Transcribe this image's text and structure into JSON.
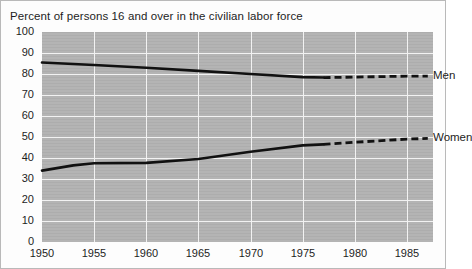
{
  "chart_data": {
    "type": "line",
    "title": "Percent of persons 16 and over in the civilian labor force",
    "xlabel": "",
    "ylabel": "",
    "xlim": [
      1950,
      1987.5
    ],
    "ylim": [
      0,
      100
    ],
    "xticks": [
      "1950",
      "1955",
      "1960",
      "1965",
      "1970",
      "1975",
      "1980",
      "1985"
    ],
    "yticks": [
      "0",
      "10",
      "20",
      "30",
      "40",
      "50",
      "60",
      "70",
      "80",
      "90",
      "100"
    ],
    "grid": true,
    "legend_position": "right-inline",
    "plot_background": "#b4b4b4",
    "gridline_color": "#f2f2f2",
    "line_color": "#111111",
    "note": "Solid segments are observed data through 1977; dashed segments are projections.",
    "series": [
      {
        "name": "Men",
        "label": "Men",
        "solid_x": [
          1950,
          1955,
          1960,
          1965,
          1970,
          1975,
          1977
        ],
        "solid_values": [
          85.5,
          84.3,
          83.0,
          81.5,
          80.0,
          78.5,
          78.3
        ],
        "dashed_x": [
          1977,
          1980,
          1985,
          1987
        ],
        "dashed_values": [
          78.3,
          78.5,
          79.0,
          79.0
        ]
      },
      {
        "name": "Women",
        "label": "Women",
        "solid_x": [
          1950,
          1953,
          1955,
          1960,
          1965,
          1970,
          1975,
          1977
        ],
        "solid_values": [
          34.0,
          36.5,
          37.5,
          37.7,
          39.5,
          43.0,
          46.0,
          46.5
        ],
        "dashed_x": [
          1977,
          1980,
          1985,
          1987
        ],
        "dashed_values": [
          46.5,
          47.5,
          49.0,
          49.3
        ]
      }
    ]
  }
}
